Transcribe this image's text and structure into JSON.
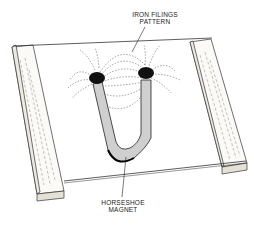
{
  "figure": {
    "labels": {
      "iron_filings": {
        "line1": "IRON FILINGS",
        "line2": "PATTERN"
      },
      "magnet": {
        "line1": "HORSESHOE",
        "line2": "MAGNET"
      }
    },
    "colors": {
      "ink": "#222222",
      "wood_face": "#e8e4dc",
      "magnet_fill": "#cfcfcf",
      "filings": "#111111",
      "background": "#ffffff"
    }
  }
}
